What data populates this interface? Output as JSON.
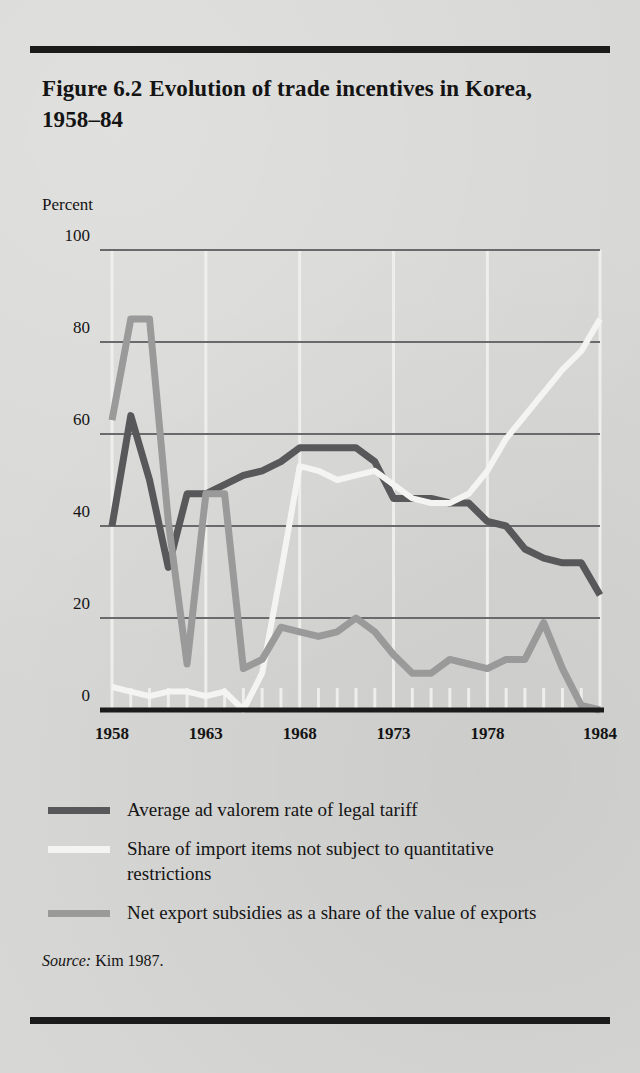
{
  "figure": {
    "number": "Figure 6.2",
    "title": "Evolution of trade incentives in Korea, 1958–84",
    "source_label": "Source:",
    "source_text": "Kim 1987."
  },
  "legend": {
    "items": [
      {
        "label": "Average ad valorem rate of legal tariff",
        "color": "#58585a",
        "swatch_name": "legend-swatch-tariff"
      },
      {
        "label": "Share of import items not subject to quantitative restrictions",
        "color": "#f4f4f2",
        "swatch_name": "legend-swatch-import-share"
      },
      {
        "label": "Net export subsidies as a share of the value of exports",
        "color": "#9a9a9a",
        "swatch_name": "legend-swatch-subsidies"
      }
    ]
  },
  "chart_data": {
    "type": "line",
    "title": "Evolution of trade incentives in Korea, 1958–84",
    "xlabel": "",
    "ylabel": "Percent",
    "ylim": [
      0,
      100
    ],
    "xlim": [
      1958,
      1984
    ],
    "yticks": [
      0,
      20,
      40,
      60,
      80,
      100
    ],
    "ytick_labels": [
      "0",
      "20",
      "40",
      "60",
      "80",
      "100"
    ],
    "xticks": [
      1958,
      1963,
      1968,
      1973,
      1978,
      1984
    ],
    "xtick_labels": [
      "1958",
      "1963",
      "1968",
      "1973",
      "1978",
      "1984"
    ],
    "x_minor_ticks": [
      1959,
      1960,
      1961,
      1962,
      1964,
      1965,
      1966,
      1967,
      1969,
      1970,
      1971,
      1972,
      1974,
      1975,
      1976,
      1977,
      1979,
      1980,
      1981,
      1982,
      1983
    ],
    "grid": {
      "horizontal": true,
      "vertical": true,
      "h_color": "#6a6a6c",
      "v_color": "#f0f0ee"
    },
    "legend_position": "below-plot",
    "x": [
      1958,
      1959,
      1960,
      1961,
      1962,
      1963,
      1964,
      1965,
      1966,
      1967,
      1968,
      1969,
      1970,
      1971,
      1972,
      1973,
      1974,
      1975,
      1976,
      1977,
      1978,
      1979,
      1980,
      1981,
      1982,
      1983,
      1984
    ],
    "series": [
      {
        "name": "Average ad valorem rate of legal tariff",
        "color": "#58585a",
        "width": 7,
        "values": [
          40,
          64,
          50,
          31,
          47,
          47,
          49,
          51,
          52,
          54,
          57,
          57,
          57,
          57,
          54,
          46,
          46,
          46,
          45,
          45,
          41,
          40,
          35,
          33,
          32,
          32,
          25
        ]
      },
      {
        "name": "Share of import items not subject to quantitative restrictions",
        "color": "#f4f4f2",
        "width": 6,
        "values": [
          5,
          4,
          3,
          4,
          4,
          3,
          4,
          0,
          8,
          30,
          53,
          52,
          50,
          51,
          52,
          49,
          46,
          45,
          45,
          47,
          52,
          59,
          64,
          69,
          74,
          78,
          85
        ]
      },
      {
        "name": "Net export subsidies as a share of the value of exports",
        "color": "#9a9a9a",
        "width": 7,
        "values": [
          63,
          85,
          85,
          41,
          10,
          47,
          47,
          9,
          11,
          18,
          17,
          16,
          17,
          20,
          17,
          12,
          8,
          8,
          11,
          10,
          9,
          11,
          11,
          19,
          9,
          1,
          0
        ]
      }
    ]
  },
  "plot_geometry": {
    "left": 112,
    "right": 600,
    "top": 250,
    "bottom": 710,
    "axis_color": "#1b1b1b"
  }
}
